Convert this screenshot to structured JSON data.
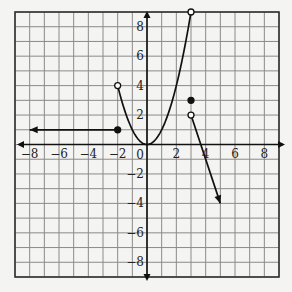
{
  "chart_data": {
    "type": "line",
    "title": "",
    "xlabel": "",
    "ylabel": "",
    "xlim": [
      -9,
      9
    ],
    "ylim": [
      -9,
      9
    ],
    "grid": true,
    "x_tick_labels": [
      "−8",
      "−6",
      "−4",
      "−2",
      "2",
      "4",
      "6",
      "8"
    ],
    "x_tick_values": [
      -8,
      -6,
      -4,
      -2,
      2,
      4,
      6,
      8
    ],
    "y_tick_labels": [
      "8",
      "6",
      "4",
      "2",
      "−2",
      "−4",
      "−6",
      "−8"
    ],
    "y_tick_values": [
      8,
      6,
      4,
      2,
      -2,
      -4,
      -6,
      -8
    ],
    "origin_label": "0",
    "series": [
      {
        "name": "piece-1-horizontal-ray",
        "kind": "ray",
        "x": [
          -8,
          -2
        ],
        "y": [
          1,
          1
        ],
        "arrow_at": "left",
        "endpoint": {
          "x": -2,
          "y": 1,
          "style": "closed"
        }
      },
      {
        "name": "piece-2-parabola",
        "kind": "curve",
        "equation": "y = x^2",
        "domain": [
          -2,
          3
        ],
        "x": [
          -2,
          -1,
          0,
          1,
          2,
          3
        ],
        "y": [
          4,
          1,
          0,
          1,
          4,
          9
        ],
        "endpoints": [
          {
            "x": -2,
            "y": 4,
            "style": "open"
          },
          {
            "x": 3,
            "y": 9,
            "style": "open"
          }
        ]
      },
      {
        "name": "piece-3-isolated-point",
        "kind": "point",
        "x": [
          3
        ],
        "y": [
          3
        ],
        "style": "closed"
      },
      {
        "name": "piece-4-decreasing-ray",
        "kind": "ray",
        "x": [
          3,
          5
        ],
        "y": [
          2,
          -4
        ],
        "arrow_at": "end",
        "endpoint": {
          "x": 3,
          "y": 2,
          "style": "open"
        }
      }
    ]
  }
}
